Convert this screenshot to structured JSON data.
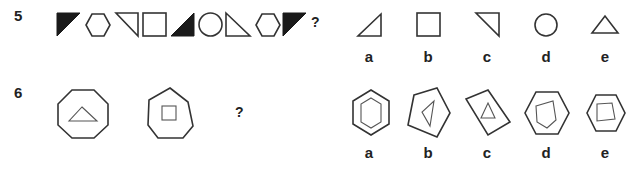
{
  "questions": [
    {
      "number": "5",
      "question_mark": "?",
      "sequence": [
        {
          "shape": "filled-right-triangle-top-left"
        },
        {
          "shape": "hexagon-outline"
        },
        {
          "shape": "right-triangle-outline-top-right"
        },
        {
          "shape": "square-outline"
        },
        {
          "shape": "filled-right-triangle-bottom-right"
        },
        {
          "shape": "circle-outline"
        },
        {
          "shape": "right-triangle-outline-bottom-left"
        },
        {
          "shape": "hexagon-outline"
        },
        {
          "shape": "filled-right-triangle-top-left"
        }
      ],
      "options": [
        {
          "label": "a",
          "shape": "right-triangle-outline-bottom-right"
        },
        {
          "label": "b",
          "shape": "square-outline"
        },
        {
          "label": "c",
          "shape": "right-triangle-outline-top-right"
        },
        {
          "label": "d",
          "shape": "circle-outline"
        },
        {
          "label": "e",
          "shape": "triangle-outline"
        }
      ]
    },
    {
      "number": "6",
      "question_mark": "?",
      "sequence": [
        {
          "shape": "octagon-with-triangle"
        },
        {
          "shape": "heptagon-with-square"
        }
      ],
      "options": [
        {
          "label": "a",
          "shape": "hexagon-with-hexagon"
        },
        {
          "label": "b",
          "shape": "pentagon-with-triangle"
        },
        {
          "label": "c",
          "shape": "rectangle-with-triangle"
        },
        {
          "label": "d",
          "shape": "hexagon-with-pentagon"
        },
        {
          "label": "e",
          "shape": "hexagon-with-quadrilateral"
        }
      ]
    }
  ]
}
